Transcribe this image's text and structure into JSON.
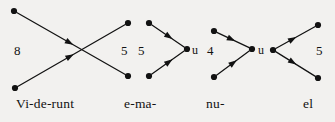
{
  "figure": {
    "background_color": "#f2f1ef",
    "ink_color": "#121212",
    "width": 335,
    "height": 122
  },
  "interval_numbers": [
    {
      "id": "n1",
      "text": "8",
      "x": 14,
      "y": 44
    },
    {
      "id": "n2",
      "text": "5",
      "x": 121,
      "y": 44
    },
    {
      "id": "n3",
      "text": "5",
      "x": 138,
      "y": 44
    },
    {
      "id": "n4",
      "text": "4",
      "x": 207,
      "y": 44
    },
    {
      "id": "n5",
      "text": "5",
      "x": 316,
      "y": 44
    }
  ],
  "node_letters": [
    {
      "id": "u1",
      "text": "u",
      "x": 192,
      "y": 44
    },
    {
      "id": "u2",
      "text": "u",
      "x": 258,
      "y": 44
    }
  ],
  "syllables": [
    {
      "id": "s1",
      "text": "Vi-de-runt",
      "x": 16,
      "y": 97
    },
    {
      "id": "s2",
      "text": "e-ma-",
      "x": 124,
      "y": 97
    },
    {
      "id": "s3",
      "text": "nu-",
      "x": 206,
      "y": 97
    },
    {
      "id": "s4",
      "text": "el",
      "x": 303,
      "y": 97
    }
  ],
  "nodes": [
    {
      "id": "g1-tl",
      "x": 14,
      "y": 11
    },
    {
      "id": "g1-bl",
      "x": 15,
      "y": 88
    },
    {
      "id": "g1-tr",
      "x": 128,
      "y": 23
    },
    {
      "id": "g1-br",
      "x": 128,
      "y": 76
    },
    {
      "id": "g2-t",
      "x": 149,
      "y": 23
    },
    {
      "id": "g2-b",
      "x": 149,
      "y": 76
    },
    {
      "id": "g2-u",
      "x": 187,
      "y": 49
    },
    {
      "id": "g3-t",
      "x": 214,
      "y": 31
    },
    {
      "id": "g3-b",
      "x": 214,
      "y": 77
    },
    {
      "id": "g3-u",
      "x": 252,
      "y": 49
    },
    {
      "id": "g4-u",
      "x": 273,
      "y": 50
    },
    {
      "id": "g4-t",
      "x": 318,
      "y": 25
    },
    {
      "id": "g4-b",
      "x": 318,
      "y": 78
    }
  ],
  "arrows": [
    {
      "id": "a1",
      "from": "g1-tl",
      "to": "g1-br",
      "head_t": 0.52,
      "label": "descending-crossing-arrow"
    },
    {
      "id": "a2",
      "from": "g1-bl",
      "to": "g1-tr",
      "head_t": 0.52,
      "label": "ascending-crossing-arrow"
    },
    {
      "id": "a3",
      "from": "g2-t",
      "to": "g2-u",
      "head_t": 0.62,
      "label": "descending-converging-arrow"
    },
    {
      "id": "a4",
      "from": "g2-b",
      "to": "g2-u",
      "head_t": 0.62,
      "label": "ascending-converging-arrow"
    },
    {
      "id": "a5",
      "from": "g3-t",
      "to": "g3-u",
      "head_t": 0.56,
      "label": "descending-converging-arrow"
    },
    {
      "id": "a6",
      "from": "g3-b",
      "to": "g3-u",
      "head_t": 0.6,
      "label": "ascending-converging-arrow"
    },
    {
      "id": "a7",
      "from": "g4-u",
      "to": "g4-t",
      "head_t": 0.52,
      "label": "ascending-diverging-arrow"
    },
    {
      "id": "a8",
      "from": "g4-u",
      "to": "g4-b",
      "head_t": 0.52,
      "label": "descending-diverging-arrow"
    }
  ],
  "style": {
    "node_radius": 3.1,
    "line_width": 1.25,
    "arrow_head_length": 8.5,
    "arrow_head_width": 6.0
  }
}
